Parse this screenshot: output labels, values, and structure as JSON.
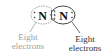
{
  "diagram": {
    "molecule": "N2",
    "atoms": [
      {
        "symbol": "N",
        "position": "left"
      },
      {
        "symbol": "N",
        "position": "right"
      }
    ],
    "bond": "triple",
    "lone_pairs_per_atom": 1,
    "octets": [
      {
        "label_line1": "Eight",
        "label_line2": "electrons",
        "side": "left",
        "color": "#a0a0a0"
      },
      {
        "label_line1": "Eight",
        "label_line2": "electrons",
        "side": "right",
        "color": "#333333"
      }
    ]
  }
}
